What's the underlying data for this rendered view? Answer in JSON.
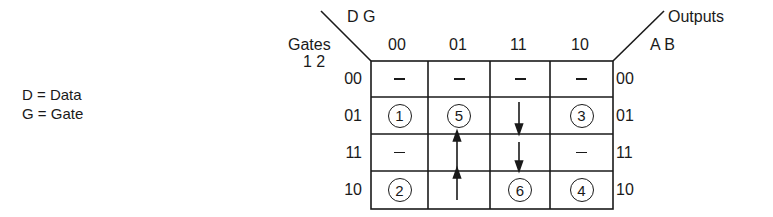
{
  "legend": {
    "items": [
      {
        "label": "D = Data"
      },
      {
        "label": "G = Gate"
      }
    ]
  },
  "map": {
    "column_var_label": "D G",
    "row_var_title": "Gates",
    "row_var_label": "1 2",
    "output_title": "Outputs",
    "output_var_label": "A B",
    "columns": [
      "00",
      "01",
      "11",
      "10"
    ],
    "rows": [
      "00",
      "01",
      "11",
      "10"
    ],
    "outputs": [
      "00",
      "01",
      "11",
      "10"
    ],
    "cells": [
      [
        "-",
        "-",
        "-",
        "-"
      ],
      [
        "1",
        "5",
        "arrow-down",
        "3"
      ],
      [
        "-",
        "arrow-up",
        "arrow-down",
        "-"
      ],
      [
        "2",
        "arrow-up",
        "6",
        "4"
      ]
    ],
    "stable_states": [
      "1",
      "2",
      "3",
      "4",
      "5",
      "6"
    ],
    "transitions": [
      {
        "from_row": "10",
        "to_row": "01",
        "column": "01",
        "direction": "up",
        "target": "5"
      },
      {
        "from_row": "01",
        "to_row": "10",
        "column": "11",
        "direction": "down",
        "target": "6"
      }
    ]
  }
}
